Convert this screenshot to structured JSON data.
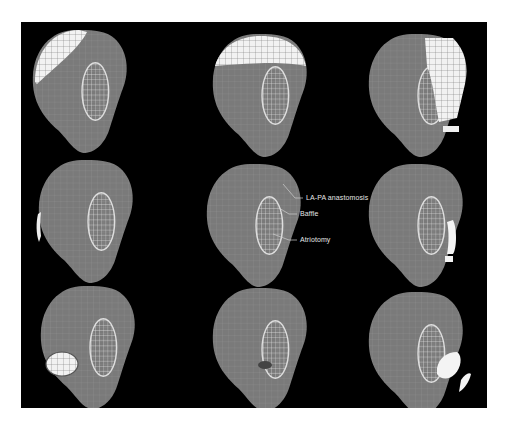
{
  "figure": {
    "background": "#000000",
    "heart_color": "#7a7a7a",
    "mesh_color": "#d8d8d8",
    "highlight_color": "#ffffff",
    "grid": {
      "rows": 3,
      "cols": 3
    },
    "panels": [
      {
        "row": 1,
        "col": 1,
        "highlight_region": "upper-left cap"
      },
      {
        "row": 1,
        "col": 2,
        "highlight_region": "upper dome"
      },
      {
        "row": 1,
        "col": 3,
        "highlight_region": "right band"
      },
      {
        "row": 2,
        "col": 1,
        "highlight_region": "left edge"
      },
      {
        "row": 2,
        "col": 2,
        "highlight_region": "none (labeled reference)"
      },
      {
        "row": 2,
        "col": 3,
        "highlight_region": "baffle right edge"
      },
      {
        "row": 3,
        "col": 1,
        "highlight_region": "lower-left patch"
      },
      {
        "row": 3,
        "col": 2,
        "highlight_region": "small lower patch"
      },
      {
        "row": 3,
        "col": 3,
        "highlight_region": "lower baffle"
      }
    ],
    "annotations": {
      "anastomosis": "LA-PA anastomosis",
      "baffle": "Baffle",
      "atriotomy": "Atriotomy"
    }
  }
}
